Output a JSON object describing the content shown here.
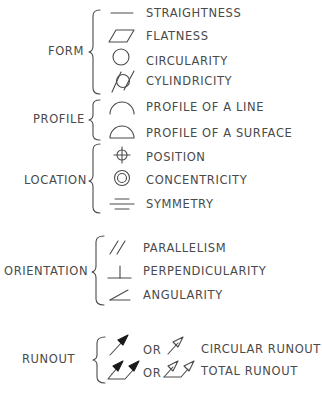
{
  "categories": [
    {
      "label": "FORM",
      "x": 48,
      "y": 52
    },
    {
      "label": "PROFILE",
      "x": 33,
      "y": 120
    },
    {
      "label": "LOCATION",
      "x": 24,
      "y": 181
    },
    {
      "label": "ORIENTATION",
      "x": 4,
      "y": 272
    },
    {
      "label": "RUNOUT",
      "x": 22,
      "y": 360
    }
  ],
  "characteristics": [
    {
      "label": "STRAIGHTNESS",
      "symbol": "straightness-icon",
      "category": "FORM",
      "y": 14
    },
    {
      "label": "FLATNESS",
      "symbol": "flatness-icon",
      "category": "FORM",
      "y": 37
    },
    {
      "label": "CIRCULARITY",
      "symbol": "circularity-icon",
      "category": "FORM",
      "y": 62
    },
    {
      "label": "CYLINDRICITY",
      "symbol": "cylindricity-icon",
      "category": "FORM",
      "y": 82
    },
    {
      "label": "PROFILE OF A LINE",
      "symbol": "profile-line-icon",
      "category": "PROFILE",
      "y": 108
    },
    {
      "label": "PROFILE OF A SURFACE",
      "symbol": "profile-surface-icon",
      "category": "PROFILE",
      "y": 134
    },
    {
      "label": "POSITION",
      "symbol": "position-icon",
      "category": "LOCATION",
      "y": 158
    },
    {
      "label": "CONCENTRICITY",
      "symbol": "concentricity-icon",
      "category": "LOCATION",
      "y": 181
    },
    {
      "label": "SYMMETRY",
      "symbol": "symmetry-icon",
      "category": "LOCATION",
      "y": 205
    },
    {
      "label": "PARALLELISM",
      "symbol": "parallelism-icon",
      "category": "ORIENTATION",
      "y": 249
    },
    {
      "label": "PERPENDICULARITY",
      "symbol": "perpendicularity-icon",
      "category": "ORIENTATION",
      "y": 272
    },
    {
      "label": "ANGULARITY",
      "symbol": "angularity-icon",
      "category": "ORIENTATION",
      "y": 296
    }
  ],
  "runout": {
    "or_label": "OR",
    "circular": {
      "label": "CIRCULAR RUNOUT",
      "y": 350
    },
    "total": {
      "label": "TOTAL RUNOUT",
      "y": 372
    }
  },
  "caption": "Figure — Geometric characteristic symbols"
}
